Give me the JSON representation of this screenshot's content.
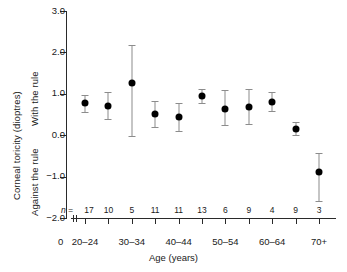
{
  "chart_data": {
    "type": "scatter",
    "title": "",
    "xlabel": "Age (years)",
    "ylabel": "Corneal toricity (dioptres)",
    "ylabel_top": "With the rule",
    "ylabel_bottom": "Against the rule",
    "origin_label": "0",
    "n_prefix": "n =",
    "ylim": [
      -2.0,
      3.0
    ],
    "yticks": [
      3.0,
      2.0,
      1.0,
      0.0,
      -1.0,
      -2.0
    ],
    "ytick_labels": [
      "3.0",
      "2.0",
      "1.0",
      "0.0",
      "−1.0",
      "−2.0"
    ],
    "grid": false,
    "legend": "none",
    "categories": [
      "20–24",
      "25–29",
      "30–34",
      "35–39",
      "40–44",
      "45–49",
      "50–54",
      "55–59",
      "60–64",
      "65–69",
      "70+"
    ],
    "xtick_labels_shown": [
      "20–24",
      "",
      "30–34",
      "",
      "40–44",
      "",
      "50–54",
      "",
      "60–64",
      "",
      "70+"
    ],
    "n_values": [
      17,
      10,
      5,
      11,
      11,
      13,
      6,
      9,
      4,
      9,
      3
    ],
    "values": [
      0.78,
      0.72,
      1.27,
      0.52,
      0.45,
      0.95,
      0.65,
      0.7,
      0.82,
      0.17,
      -0.88
    ],
    "err_low": [
      0.58,
      0.4,
      0.0,
      0.22,
      0.12,
      0.8,
      0.25,
      0.28,
      0.6,
      0.02,
      -1.58
    ],
    "err_high": [
      0.98,
      1.05,
      2.18,
      0.85,
      0.8,
      1.13,
      1.1,
      1.12,
      1.05,
      0.32,
      -0.42
    ]
  },
  "colors": {
    "marker": "#000000",
    "errorbar": "#8c8c8c",
    "axis": "#2a2a2a",
    "background": "#ffffff"
  }
}
